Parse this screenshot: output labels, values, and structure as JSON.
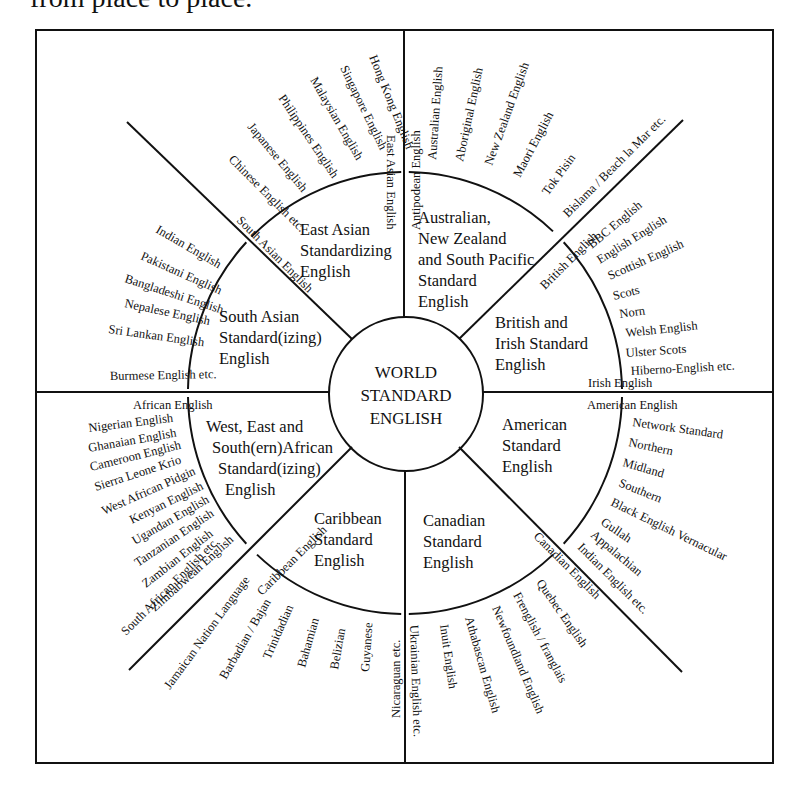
{
  "caption_fragment": "from place to place.",
  "center": {
    "lines": [
      "WORLD",
      "STANDARD",
      "ENGLISH"
    ]
  },
  "regions": [
    {
      "id": "east-asian",
      "lines": [
        "East Asian",
        "Standardizing",
        "English"
      ],
      "ring_label": "East Asian English",
      "varieties": [
        "Hong Kong English",
        "Singapore English",
        "Malaysian English",
        "Philippines English",
        "Japanese English",
        "Chinese English etc."
      ]
    },
    {
      "id": "australian",
      "lines": [
        "Australian,",
        "New Zealand",
        "and South Pacific",
        "Standard",
        "English"
      ],
      "ring_label": "Antipodean English",
      "varieties": [
        "Australian English",
        "Aboriginal English",
        "New Zealand English",
        "Maori English",
        "Tok Pisin",
        "Bislama / Beach la Mar etc."
      ]
    },
    {
      "id": "british",
      "lines": [
        "British and",
        "Irish Standard",
        "English"
      ],
      "ring_label": "British English",
      "ring_label_2": "Irish English",
      "varieties": [
        "BBC English",
        "English English",
        "Scottish English",
        "Scots",
        "Norn",
        "Welsh English",
        "Ulster Scots",
        "Hiberno-English etc."
      ]
    },
    {
      "id": "american",
      "lines": [
        "American",
        "Standard",
        "English"
      ],
      "ring_label": "American English",
      "varieties": [
        "Network Standard",
        "Northern",
        "Midland",
        "Southern",
        "Black English Vernacular",
        "Gullah",
        "Appalachian",
        "Indian English etc."
      ]
    },
    {
      "id": "canadian",
      "lines": [
        "Canadian",
        "Standard",
        "English"
      ],
      "ring_label": "Canadian English",
      "varieties": [
        "Quebec English",
        "Frenglish / franglais",
        "Newfoundland English",
        "Athabascan English",
        "Inuit English",
        "Ukrainian English etc."
      ]
    },
    {
      "id": "caribbean",
      "lines": [
        "Caribbean",
        "Standard",
        "English"
      ],
      "ring_label": "Caribbean English",
      "varieties": [
        "Jamaican Nation Language",
        "Barbadian / Bajan",
        "Trinidadian",
        "Bahamian",
        "Belizian",
        "Guyanese",
        "Nicaraguan etc."
      ]
    },
    {
      "id": "african",
      "lines": [
        "West, East and",
        "South(ern)African",
        "Standard(izing)",
        "English"
      ],
      "ring_label": "African English",
      "varieties": [
        "Nigerian English",
        "Ghanaian English",
        "Cameroon English",
        "Sierra Leone Krio",
        "West African Pidgin",
        "Kenyan English",
        "Ugandan English",
        "Tanzanian English",
        "Zambian English",
        "Zimbabwean English",
        "South African English etc."
      ]
    },
    {
      "id": "south-asian",
      "lines": [
        "South Asian",
        "Standard(izing)",
        "English"
      ],
      "ring_label": "South Asian English",
      "varieties": [
        "Indian English",
        "Pakistani English",
        "Bangladeshi English",
        "Nepalese English",
        "Sri Lankan English",
        "Burmese English etc."
      ]
    }
  ]
}
